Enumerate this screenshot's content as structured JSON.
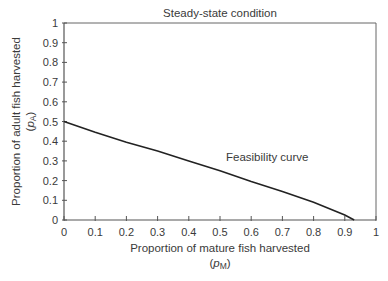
{
  "chart_data": {
    "type": "line",
    "title": "Steady-state condition",
    "xlabel": "Proportion of mature fish harvested",
    "xlabel_symbol": "p",
    "xlabel_subscript": "M",
    "ylabel": "Proportion of adult fish harvested",
    "ylabel_symbol": "p",
    "ylabel_subscript": "A",
    "xlim": [
      0,
      1
    ],
    "ylim": [
      0,
      1
    ],
    "xticks": [
      0,
      0.1,
      0.2,
      0.3,
      0.4,
      0.5,
      0.6,
      0.7,
      0.8,
      0.9,
      1
    ],
    "xtick_labels": [
      "0",
      "0.1",
      "0.2",
      "0.3",
      "0.4",
      "0.5",
      "0.6",
      "0.7",
      "0.8",
      "0.9",
      "1"
    ],
    "yticks": [
      0,
      0.1,
      0.2,
      0.3,
      0.4,
      0.5,
      0.6,
      0.7,
      0.8,
      0.9,
      1
    ],
    "ytick_labels": [
      "0",
      "0.1",
      "0.2",
      "0.3",
      "0.4",
      "0.5",
      "0.6",
      "0.7",
      "0.8",
      "0.9",
      "1"
    ],
    "grid": false,
    "legend": null,
    "series": [
      {
        "name": "Feasibility curve",
        "x": [
          0,
          0.1,
          0.2,
          0.3,
          0.4,
          0.5,
          0.6,
          0.7,
          0.8,
          0.9,
          0.93
        ],
        "y": [
          0.5,
          0.445,
          0.395,
          0.35,
          0.3,
          0.25,
          0.195,
          0.145,
          0.09,
          0.025,
          0.0
        ],
        "color": "#222222"
      }
    ],
    "annotations": [
      {
        "text": "Feasibility curve",
        "x": 0.52,
        "y": 0.32
      }
    ]
  },
  "colors": {
    "axis": "#555555",
    "curve": "#222222",
    "text": "#3a3a3a"
  }
}
